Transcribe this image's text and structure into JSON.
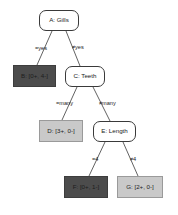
{
  "diagram": {
    "type": "decision-tree",
    "canvas": {
      "width": 178,
      "height": 215,
      "background": "#ffffff"
    },
    "colors": {
      "leaf_negative_fill": "#4c4c4c",
      "leaf_positive_fill": "#c9c9c9",
      "internal_fill": "#ffffff",
      "stroke": "#3a3a3a",
      "text": "#1a1a1a"
    },
    "nodes": [
      {
        "id": "A",
        "kind": "internal",
        "label": "A: Gills",
        "x": 39,
        "y": 10,
        "w": 40,
        "h": 21
      },
      {
        "id": "B",
        "kind": "leaf",
        "variant": "negative",
        "label": "B: [0+, 4-]",
        "x": 13,
        "y": 65,
        "w": 43,
        "h": 22
      },
      {
        "id": "C",
        "kind": "internal",
        "label": "C: Teeth",
        "x": 65,
        "y": 66,
        "w": 40,
        "h": 21
      },
      {
        "id": "D",
        "kind": "leaf",
        "variant": "positive",
        "label": "D: [3+, 0-]",
        "x": 39,
        "y": 120,
        "w": 44,
        "h": 22
      },
      {
        "id": "E",
        "kind": "internal",
        "label": "E: Length",
        "x": 93,
        "y": 121,
        "w": 43,
        "h": 21
      },
      {
        "id": "F",
        "kind": "leaf",
        "variant": "negative",
        "label": "F: [0+, 1-]",
        "x": 64,
        "y": 176,
        "w": 44,
        "h": 22
      },
      {
        "id": "G",
        "kind": "leaf",
        "variant": "positive",
        "label": "G: [2+, 0-]",
        "x": 117,
        "y": 176,
        "w": 46,
        "h": 22
      }
    ],
    "edges": [
      {
        "from": "A",
        "to": "B",
        "label": "=yes",
        "x1": 52,
        "y1": 31,
        "x2": 37,
        "y2": 65,
        "label_x": 35,
        "label_y": 46
      },
      {
        "from": "A",
        "to": "C",
        "label": "≠yes",
        "x1": 66,
        "y1": 31,
        "x2": 80,
        "y2": 66,
        "label_x": 72,
        "label_y": 45
      },
      {
        "from": "C",
        "to": "D",
        "label": "=many",
        "x1": 77,
        "y1": 87,
        "x2": 62,
        "y2": 120,
        "label_x": 56,
        "label_y": 101
      },
      {
        "from": "C",
        "to": "E",
        "label": "≠many",
        "x1": 93,
        "y1": 87,
        "x2": 110,
        "y2": 121,
        "label_x": 99,
        "label_y": 101
      },
      {
        "from": "E",
        "to": "F",
        "label": "=4",
        "x1": 105,
        "y1": 142,
        "x2": 89,
        "y2": 176,
        "label_x": 92,
        "label_y": 157
      },
      {
        "from": "E",
        "to": "G",
        "label": "≠4",
        "x1": 123,
        "y1": 142,
        "x2": 138,
        "y2": 176,
        "label_x": 130,
        "label_y": 157
      }
    ]
  }
}
